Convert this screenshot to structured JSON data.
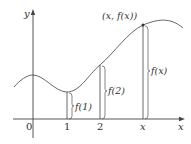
{
  "diagram": {
    "axes": {
      "x_label": "x",
      "y_label": "y",
      "origin_label": "0"
    },
    "ticks": [
      {
        "label": "1"
      },
      {
        "label": "2"
      },
      {
        "label": "x"
      }
    ],
    "point_label": "(x, f(x))",
    "height_labels": {
      "f1": "f(1)",
      "f2": "f(2)",
      "fx": "f(x)"
    },
    "colors": {
      "line": "#444444",
      "text": "#333333"
    }
  }
}
